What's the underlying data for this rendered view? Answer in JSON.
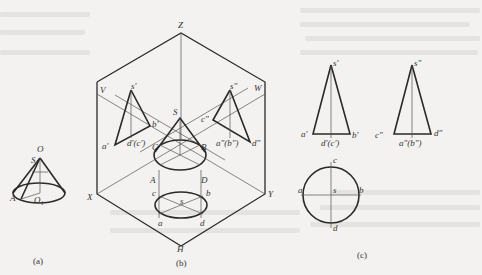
{
  "figure": {
    "background_color": "#f3f2f0",
    "line_color": "#2a2a2a",
    "panels": [
      {
        "id": "a",
        "caption": "(a)",
        "labels": {
          "apex_top": "O",
          "apex": "S",
          "base_point": "A",
          "base_center": "O₁"
        }
      },
      {
        "id": "b",
        "caption": "(b)",
        "plane_labels": {
          "z_axis": "Z",
          "v_plane": "V",
          "w_plane": "W",
          "x_axis": "X",
          "y_axis": "Y",
          "h_plane": "H"
        },
        "front_view_labels": {
          "apex": "s'",
          "left": "a'",
          "right": "b'",
          "center": "d'(c')"
        },
        "side_view_labels": {
          "apex": "s\"",
          "left": "c\"",
          "right": "d\"",
          "center": "a\"(b\")"
        },
        "cone_labels": {
          "apex": "S",
          "left": "C",
          "right": "B",
          "front_left": "A",
          "front_right": "D"
        },
        "top_view_labels": {
          "top": "c",
          "right": "b",
          "center": "s",
          "bottom_left": "a",
          "bottom_right": "d"
        }
      },
      {
        "id": "c",
        "caption": "(c)",
        "front_view_labels": {
          "apex": "s'",
          "left": "a'",
          "right": "b'",
          "center": "d'(c')"
        },
        "side_view_labels": {
          "apex": "s\"",
          "left": "c\"",
          "right": "d\"",
          "center": "a\"(b\")"
        },
        "top_view_labels": {
          "top": "c",
          "left": "a",
          "right": "b",
          "center": "s",
          "bottom": "d"
        }
      }
    ]
  }
}
